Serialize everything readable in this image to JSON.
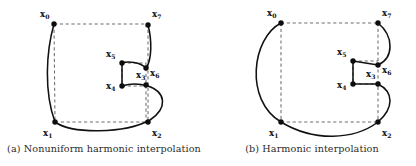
{
  "figure": {
    "panels": [
      {
        "id": "a",
        "caption": "(a) Nonuniform harmonic interpolation",
        "points": [
          {
            "name": "x0",
            "label": "x",
            "sub": "0",
            "cx": 54,
            "cy": 24,
            "lx": 40,
            "ly": 17
          },
          {
            "name": "x1",
            "label": "x",
            "sub": "1",
            "cx": 55,
            "cy": 122,
            "lx": 43,
            "ly": 136
          },
          {
            "name": "x2",
            "label": "x",
            "sub": "2",
            "cx": 148,
            "cy": 122,
            "lx": 152,
            "ly": 136
          },
          {
            "name": "x3",
            "label": "x",
            "sub": "3",
            "cx": 146,
            "cy": 85,
            "lx": 136,
            "ly": 78
          },
          {
            "name": "x4",
            "label": "x",
            "sub": "4",
            "cx": 122,
            "cy": 86,
            "lx": 106,
            "ly": 89
          },
          {
            "name": "x5",
            "label": "x",
            "sub": "5",
            "cx": 122,
            "cy": 63,
            "lx": 106,
            "ly": 57
          },
          {
            "name": "x6",
            "label": "x",
            "sub": "6",
            "cx": 146,
            "cy": 68,
            "lx": 150,
            "ly": 76
          },
          {
            "name": "x7",
            "label": "x",
            "sub": "7",
            "cx": 148,
            "cy": 25,
            "lx": 152,
            "ly": 17
          }
        ],
        "dashed_path": "M54,24 L148,24 M148,24 L148,122 M55,122 L148,122 M54,24 L55,122 M122,63 L146,63 L146,68 M122,86 L146,86 M146,68 L146,122 M122,63 L122,86",
        "solid_path": "M54,24 C46,52 44,92 55,122 C72,134 124,134 150,120 C168,108 166,92 148,86 C138,83 128,84 122,86 L122,63 C128,61 140,62 146,68 C152,60 152,40 148,25"
      },
      {
        "id": "b",
        "caption": "(b) Harmonic interpolation",
        "points": [
          {
            "name": "x0",
            "label": "x",
            "sub": "0",
            "cx": 73,
            "cy": 23,
            "lx": 59,
            "ly": 16
          },
          {
            "name": "x1",
            "label": "x",
            "sub": "1",
            "cx": 73,
            "cy": 122,
            "lx": 61,
            "ly": 136
          },
          {
            "name": "x2",
            "label": "x",
            "sub": "2",
            "cx": 170,
            "cy": 122,
            "lx": 174,
            "ly": 136
          },
          {
            "name": "x3",
            "label": "x",
            "sub": "3",
            "cx": 170,
            "cy": 84,
            "lx": 158,
            "ly": 77
          },
          {
            "name": "x4",
            "label": "x",
            "sub": "4",
            "cx": 145,
            "cy": 84,
            "lx": 129,
            "ly": 88
          },
          {
            "name": "x5",
            "label": "x",
            "sub": "5",
            "cx": 145,
            "cy": 61,
            "lx": 129,
            "ly": 55
          },
          {
            "name": "x6",
            "label": "x",
            "sub": "6",
            "cx": 170,
            "cy": 65,
            "lx": 174,
            "ly": 73
          },
          {
            "name": "x7",
            "label": "x",
            "sub": "7",
            "cx": 170,
            "cy": 23,
            "lx": 174,
            "ly": 16
          }
        ],
        "dashed_path": "M73,23 L170,23 M170,23 L170,122 M73,122 L170,122 M73,23 L73,122 M145,61 L170,61 M145,84 L170,84 M145,61 L145,84",
        "solid_path": "M73,23 C44,38 36,100 73,122 C106,142 146,140 170,122 C186,108 186,92 170,84 L145,84 L145,61 L170,65 C186,58 186,36 170,23"
      }
    ]
  }
}
